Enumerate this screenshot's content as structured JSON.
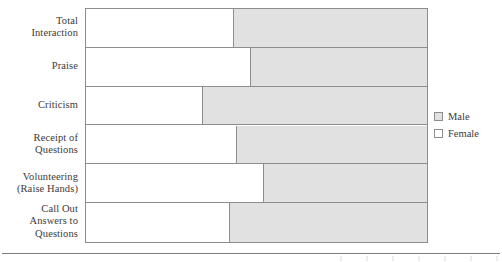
{
  "chart_data": {
    "type": "bar",
    "orientation": "horizontal",
    "stacked": true,
    "normalized": true,
    "title": "",
    "xlabel": "",
    "ylabel": "",
    "grid": false,
    "xlim": [
      0,
      100
    ],
    "axis_tick_labels": [],
    "legend_position": "right",
    "categories": [
      "Total\nInteraction",
      "Praise",
      "Criticism",
      "Receipt of\nQuestions",
      "Volunteering\n(Raise Hands)",
      "Call Out\nAnswers to\nQuestions"
    ],
    "series": [
      {
        "name": "Female",
        "color": "#ffffff",
        "values": [
          43,
          48,
          34,
          44,
          52,
          42
        ]
      },
      {
        "name": "Male",
        "color": "#e1e1e1",
        "values": [
          57,
          52,
          66,
          56,
          48,
          58
        ]
      }
    ]
  },
  "legend": {
    "items": [
      {
        "label": "Male",
        "swatch": "male"
      },
      {
        "label": "Female",
        "swatch": "female"
      }
    ]
  },
  "colors": {
    "male_fill": "#e1e1e1",
    "female_fill": "#ffffff",
    "outline": "#8d8d8d",
    "text": "#3c3a38",
    "rule": "#7d7d7d"
  }
}
